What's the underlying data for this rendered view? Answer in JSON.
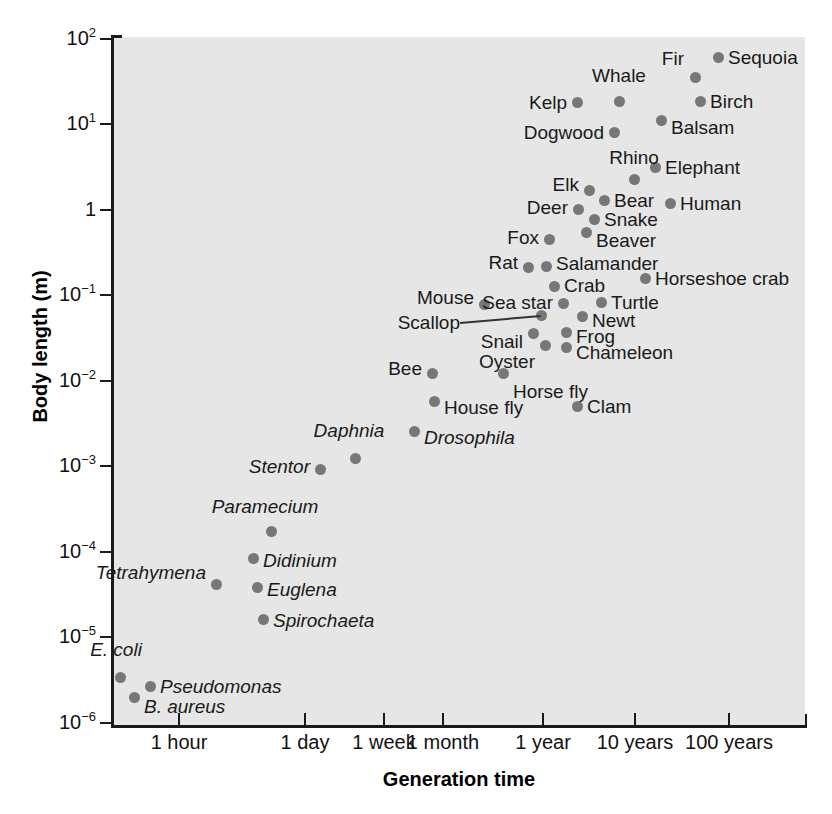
{
  "chart_data": {
    "type": "scatter",
    "title": "",
    "xlabel": "Generation time",
    "ylabel": "Body length (m)",
    "grid": false,
    "legend": null,
    "x_tick_labels": [
      "1 hour",
      "1 day",
      "1 week",
      "1 month",
      "1 year",
      "10 years",
      "100 years"
    ],
    "x_tick_px": [
      179,
      305,
      384,
      443,
      543,
      635,
      729
    ],
    "y_tick_labels": [
      "10",
      "10",
      "1",
      "10",
      "10",
      "10",
      "10",
      "10",
      "10"
    ],
    "y_tick_exponents": [
      "2",
      "1",
      "",
      "-1",
      "-2",
      "-3",
      "-4",
      "-5",
      "-6"
    ],
    "y_tick_px": [
      39,
      124,
      210,
      295,
      381,
      466,
      552,
      637,
      723
    ],
    "ylim": [
      1e-06,
      100
    ],
    "points": [
      {
        "name": "Sequoia",
        "x": 718,
        "y": 57,
        "lx": 728,
        "ly": 57,
        "anchor": "right",
        "italic": false
      },
      {
        "name": "Fir",
        "x": 695,
        "y": 77,
        "lx": 684,
        "ly": 58,
        "anchor": "left",
        "italic": false
      },
      {
        "name": "Whale",
        "x": 619,
        "y": 101,
        "lx": 619,
        "ly": 85,
        "anchor": "above",
        "italic": false
      },
      {
        "name": "Birch",
        "x": 700,
        "y": 101,
        "lx": 710,
        "ly": 101,
        "anchor": "right",
        "italic": false
      },
      {
        "name": "Kelp",
        "x": 577,
        "y": 102,
        "lx": 567,
        "ly": 102,
        "anchor": "left",
        "italic": false
      },
      {
        "name": "Balsam",
        "x": 661,
        "y": 120,
        "lx": 671,
        "ly": 127,
        "anchor": "right",
        "italic": false
      },
      {
        "name": "Dogwood",
        "x": 614,
        "y": 132,
        "lx": 604,
        "ly": 132,
        "anchor": "left",
        "italic": false
      },
      {
        "name": "Elephant",
        "x": 655,
        "y": 167,
        "lx": 665,
        "ly": 167,
        "anchor": "right",
        "italic": false
      },
      {
        "name": "Rhino",
        "x": 634,
        "y": 179,
        "lx": 634,
        "ly": 167,
        "anchor": "above",
        "italic": false
      },
      {
        "name": "Elk",
        "x": 589,
        "y": 190,
        "lx": 579,
        "ly": 184,
        "anchor": "left",
        "italic": false
      },
      {
        "name": "Bear",
        "x": 604,
        "y": 200,
        "lx": 614,
        "ly": 200,
        "anchor": "right",
        "italic": false
      },
      {
        "name": "Human",
        "x": 670,
        "y": 203,
        "lx": 680,
        "ly": 203,
        "anchor": "right",
        "italic": false
      },
      {
        "name": "Deer",
        "x": 578,
        "y": 209,
        "lx": 568,
        "ly": 207,
        "anchor": "left",
        "italic": false
      },
      {
        "name": "Snake",
        "x": 594,
        "y": 219,
        "lx": 604,
        "ly": 219,
        "anchor": "right",
        "italic": false
      },
      {
        "name": "Beaver",
        "x": 586,
        "y": 232,
        "lx": 596,
        "ly": 240,
        "anchor": "right",
        "italic": false
      },
      {
        "name": "Fox",
        "x": 549,
        "y": 239,
        "lx": 539,
        "ly": 237,
        "anchor": "left",
        "italic": false
      },
      {
        "name": "Salamander",
        "x": 546,
        "y": 266,
        "lx": 556,
        "ly": 263,
        "anchor": "right",
        "italic": false
      },
      {
        "name": "Rat",
        "x": 528,
        "y": 267,
        "lx": 518,
        "ly": 262,
        "anchor": "left",
        "italic": false
      },
      {
        "name": "Crab",
        "x": 554,
        "y": 286,
        "lx": 564,
        "ly": 285,
        "anchor": "right",
        "italic": false
      },
      {
        "name": "Horseshoe crab",
        "x": 645,
        "y": 278,
        "lx": 655,
        "ly": 278,
        "anchor": "right",
        "italic": false
      },
      {
        "name": "Mouse",
        "x": 484,
        "y": 304,
        "lx": 474,
        "ly": 297,
        "anchor": "left",
        "italic": false
      },
      {
        "name": "Sea star",
        "x": 563,
        "y": 303,
        "lx": 553,
        "ly": 302,
        "anchor": "left",
        "italic": false
      },
      {
        "name": "Turtle",
        "x": 601,
        "y": 302,
        "lx": 611,
        "ly": 302,
        "anchor": "right",
        "italic": false
      },
      {
        "name": "Scallop",
        "x": 541,
        "y": 315,
        "lx": 460,
        "ly": 322,
        "anchor": "left-leader",
        "italic": false
      },
      {
        "name": "Newt",
        "x": 582,
        "y": 316,
        "lx": 592,
        "ly": 320,
        "anchor": "right",
        "italic": false
      },
      {
        "name": "Snail",
        "x": 533,
        "y": 333,
        "lx": 523,
        "ly": 341,
        "anchor": "left",
        "italic": false
      },
      {
        "name": "Frog",
        "x": 566,
        "y": 332,
        "lx": 576,
        "ly": 336,
        "anchor": "right",
        "italic": false
      },
      {
        "name": "Chameleon",
        "x": 566,
        "y": 347,
        "lx": 576,
        "ly": 352,
        "anchor": "right",
        "italic": false
      },
      {
        "name": "Oyster",
        "x": 545,
        "y": 345,
        "lx": 535,
        "ly": 361,
        "anchor": "left",
        "italic": false
      },
      {
        "name": "Bee",
        "x": 432,
        "y": 373,
        "lx": 422,
        "ly": 368,
        "anchor": "left",
        "italic": false
      },
      {
        "name": "Horse fly",
        "x": 503,
        "y": 373,
        "lx": 513,
        "ly": 391,
        "anchor": "right",
        "italic": false
      },
      {
        "name": "Clam",
        "x": 577,
        "y": 406,
        "lx": 587,
        "ly": 406,
        "anchor": "right",
        "italic": false
      },
      {
        "name": "House fly",
        "x": 434,
        "y": 401,
        "lx": 444,
        "ly": 407,
        "anchor": "right",
        "italic": false
      },
      {
        "name": "Drosophila",
        "x": 414,
        "y": 431,
        "lx": 424,
        "ly": 437,
        "anchor": "right",
        "italic": true
      },
      {
        "name": "Daphnia",
        "x": 355,
        "y": 458,
        "lx": 349,
        "ly": 440,
        "anchor": "above",
        "italic": true
      },
      {
        "name": "Stentor",
        "x": 320,
        "y": 469,
        "lx": 310,
        "ly": 466,
        "anchor": "left",
        "italic": true
      },
      {
        "name": "Paramecium",
        "x": 271,
        "y": 531,
        "lx": 265,
        "ly": 516,
        "anchor": "above",
        "italic": true
      },
      {
        "name": "Didinium",
        "x": 253,
        "y": 558,
        "lx": 263,
        "ly": 560,
        "anchor": "right",
        "italic": true
      },
      {
        "name": "Tetrahymena",
        "x": 216,
        "y": 584,
        "lx": 206,
        "ly": 572,
        "anchor": "left",
        "italic": true
      },
      {
        "name": "Euglena",
        "x": 257,
        "y": 587,
        "lx": 267,
        "ly": 589,
        "anchor": "right",
        "italic": true
      },
      {
        "name": "Spirochaeta",
        "x": 263,
        "y": 619,
        "lx": 273,
        "ly": 620,
        "anchor": "right",
        "italic": true
      },
      {
        "name": "E. coli",
        "x": 120,
        "y": 677,
        "lx": 116,
        "ly": 659,
        "anchor": "above-left",
        "italic": true
      },
      {
        "name": "Pseudomonas",
        "x": 150,
        "y": 686,
        "lx": 160,
        "ly": 686,
        "anchor": "right",
        "italic": true
      },
      {
        "name": "B. aureus",
        "x": 134,
        "y": 697,
        "lx": 144,
        "ly": 706,
        "anchor": "right",
        "italic": true
      }
    ]
  }
}
